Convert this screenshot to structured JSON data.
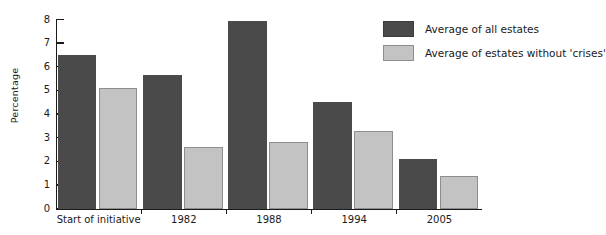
{
  "chart_data": {
    "type": "bar",
    "title": "",
    "subtitle": "",
    "xlabel": "",
    "ylabel": "Percentage",
    "ylim": [
      0,
      8
    ],
    "ytick_labels": [
      "0",
      "1",
      "2",
      "3",
      "4",
      "5",
      "6",
      "7",
      "8"
    ],
    "yticks": [
      0,
      1,
      2,
      3,
      4,
      5,
      6,
      7,
      8
    ],
    "grid": false,
    "legend_position": "top-right",
    "categories": [
      "Start of initiative",
      "1982",
      "1988",
      "1994",
      "2005"
    ],
    "series": [
      {
        "name": "Average of all estates",
        "color": "#4a4a4a",
        "values": [
          6.5,
          5.65,
          7.95,
          4.5,
          2.1
        ]
      },
      {
        "name": "Average of estates without 'crises'",
        "color": "#c3c3c3",
        "values": [
          5.1,
          2.6,
          2.8,
          3.3,
          1.4
        ]
      }
    ]
  },
  "legend": {
    "items": [
      {
        "label": "Average of all estates",
        "swatch": "dark"
      },
      {
        "label": "Average of estates without 'crises'",
        "swatch": "light"
      }
    ]
  }
}
